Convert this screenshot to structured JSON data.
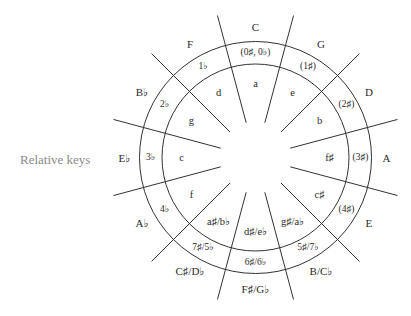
{
  "diagram": {
    "side_label": "Relative keys",
    "line_color": "#333333",
    "text_color": "#2b2b2b",
    "side_label_color": "#8a8a8a",
    "geometry": {
      "cx": 255.5,
      "cy": 157.5,
      "outer_radius": 116,
      "inner_radius": 93.5,
      "spoke_inner_radius": 36,
      "spoke_outer_radius": 147,
      "major_label_radius": 131,
      "sig_label_radius": 105,
      "minor_label_radius": 74
    },
    "segments": [
      {
        "major": "C",
        "signature": "(0♯, 0♭)",
        "minor": "a"
      },
      {
        "major": "G",
        "signature": "(1♯)",
        "minor": "e"
      },
      {
        "major": "D",
        "signature": "(2♯)",
        "minor": "b"
      },
      {
        "major": "A",
        "signature": "(3♯)",
        "minor": "f♯"
      },
      {
        "major": "E",
        "signature": "(4♯)",
        "minor": "c♯"
      },
      {
        "major": "B/C♭",
        "signature": "5♯/7♭",
        "minor": "g♯/a♭"
      },
      {
        "major": "F♯/G♭",
        "signature": "6♯/6♭",
        "minor": "d♯/e♭"
      },
      {
        "major": "C♯/D♭",
        "signature": "7♯/5♭",
        "minor": "a♯/b♭"
      },
      {
        "major": "A♭",
        "signature": "4♭",
        "minor": "f"
      },
      {
        "major": "E♭",
        "signature": "3♭",
        "minor": "c"
      },
      {
        "major": "B♭",
        "signature": "2♭",
        "minor": "g"
      },
      {
        "major": "F",
        "signature": "1♭",
        "minor": "d"
      }
    ]
  }
}
